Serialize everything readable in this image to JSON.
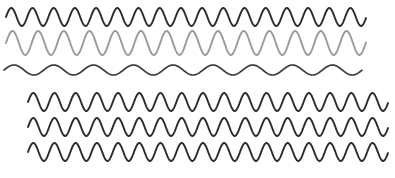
{
  "figure": {
    "background_color": "#ffffff",
    "width": 395,
    "height": 178
  },
  "chart_data": {
    "type": "line",
    "subtitle": "",
    "xlabel": "",
    "ylabel": "",
    "xlim": [
      0,
      395
    ],
    "ylim": [
      0,
      178
    ],
    "grid": false,
    "legend": "none",
    "axes_visible": false,
    "tick_labels": [],
    "annotations": [],
    "groups": [
      {
        "name": "group-upper",
        "x_start": 6,
        "x_end": 366,
        "traces": [
          "trace-1",
          "trace-2",
          "trace-3"
        ]
      },
      {
        "name": "group-lower",
        "x_start": 28,
        "x_end": 388,
        "traces": [
          "trace-4",
          "trace-5",
          "trace-6"
        ]
      }
    ],
    "series": [
      {
        "name": "trace-1",
        "group": "group-upper",
        "waveform": "sine",
        "color": "#2b2b2b",
        "stroke_width": 1.9,
        "x_start": 6,
        "x_end": 366,
        "baseline_y": 17,
        "amplitude": 9,
        "period": 21.2,
        "phase_deg": 180,
        "cycles": 17
      },
      {
        "name": "trace-2",
        "group": "group-upper",
        "waveform": "sine",
        "color": "#9a9a9a",
        "stroke_width": 1.9,
        "x_start": 6,
        "x_end": 366,
        "baseline_y": 43,
        "amplitude": 12,
        "period": 25.7,
        "phase_deg": 180,
        "cycles": 14
      },
      {
        "name": "trace-3",
        "group": "group-upper",
        "waveform": "sine",
        "color": "#3a3a3a",
        "stroke_width": 1.7,
        "x_start": 4,
        "x_end": 362,
        "baseline_y": 70,
        "amplitude": 5,
        "period": 39.8,
        "phase_deg": 180,
        "cycles": 9
      },
      {
        "name": "trace-4",
        "group": "group-lower",
        "waveform": "sine",
        "color": "#2b2b2b",
        "stroke_width": 1.9,
        "x_start": 28,
        "x_end": 388,
        "baseline_y": 102,
        "amplitude": 9,
        "period": 21.2,
        "phase_deg": 180,
        "cycles": 17
      },
      {
        "name": "trace-5",
        "group": "group-lower",
        "waveform": "sine",
        "color": "#2b2b2b",
        "stroke_width": 1.9,
        "x_start": 28,
        "x_end": 388,
        "baseline_y": 127,
        "amplitude": 9,
        "period": 21.2,
        "phase_deg": 180,
        "cycles": 17
      },
      {
        "name": "trace-6",
        "group": "group-lower",
        "waveform": "sine",
        "color": "#2b2b2b",
        "stroke_width": 1.9,
        "x_start": 28,
        "x_end": 388,
        "baseline_y": 152,
        "amplitude": 9,
        "period": 21.2,
        "phase_deg": 180,
        "cycles": 17
      }
    ]
  }
}
